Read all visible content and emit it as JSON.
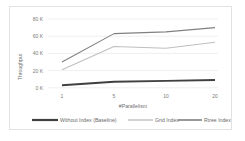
{
  "chart_data": {
    "type": "line",
    "title": "",
    "xlabel": "#Parallelism",
    "ylabel": "Throughput",
    "categories": [
      "1",
      "5",
      "10",
      "20"
    ],
    "ytick_labels": [
      "0 K",
      "20 K",
      "40 K",
      "60 K",
      "80 K"
    ],
    "ytick_values": [
      0,
      20000,
      40000,
      60000,
      80000
    ],
    "ylim": [
      0,
      80000
    ],
    "grid": true,
    "legend_position": "bottom",
    "series": [
      {
        "name": "Without Index (Baseline)",
        "values": [
          3000,
          7000,
          8000,
          9000
        ],
        "color": "#404040",
        "width": 1.9
      },
      {
        "name": "Grid Index",
        "values": [
          21000,
          48000,
          46000,
          53000
        ],
        "color": "#bfbfbf",
        "width": 1.1
      },
      {
        "name": "Rtree Index",
        "values": [
          30000,
          63000,
          65000,
          70000
        ],
        "color": "#808080",
        "width": 1.1
      }
    ]
  },
  "axis": {
    "y_title": "Throughput",
    "x_title": "#Parallelism",
    "y_ticks": [
      "80 K",
      "60 K",
      "40 K",
      "20 K",
      "0 K"
    ],
    "x_ticks": [
      "1",
      "5",
      "10",
      "20"
    ]
  },
  "legend": {
    "items": [
      {
        "label": "Without Index (Baseline)",
        "color": "#404040"
      },
      {
        "label": "Grid Index",
        "color": "#bfbfbf"
      },
      {
        "label": "Rtree Index",
        "color": "#808080"
      }
    ]
  }
}
